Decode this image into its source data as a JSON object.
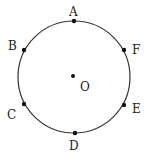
{
  "diagram": {
    "type": "circle-with-points",
    "circle": {
      "cx": 74,
      "cy": 77,
      "r": 56,
      "stroke": "#333333"
    },
    "center": {
      "label": "O",
      "x": 73,
      "y": 76,
      "label_x": 80,
      "label_y": 91
    },
    "points": [
      {
        "label": "A",
        "x": 74,
        "y": 21,
        "label_x": 69,
        "label_y": 16
      },
      {
        "label": "B",
        "x": 24,
        "y": 50,
        "label_x": 8,
        "label_y": 50
      },
      {
        "label": "F",
        "x": 124,
        "y": 50,
        "label_x": 132,
        "label_y": 54
      },
      {
        "label": "C",
        "x": 24,
        "y": 104,
        "label_x": 7,
        "label_y": 119
      },
      {
        "label": "E",
        "x": 124,
        "y": 105,
        "label_x": 132,
        "label_y": 113
      },
      {
        "label": "D",
        "x": 75,
        "y": 133,
        "label_x": 69,
        "label_y": 150
      }
    ]
  }
}
